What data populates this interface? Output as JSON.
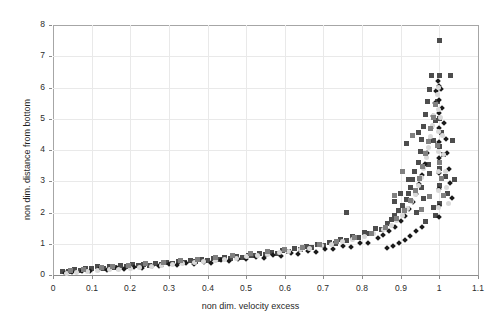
{
  "chart_data": {
    "type": "scatter",
    "title": "",
    "xlabel": "non dim. velocity excess",
    "ylabel": "non dim. distance from bottom",
    "xlim": [
      0,
      1.1
    ],
    "ylim": [
      0,
      8
    ],
    "xticks": [
      "0",
      "0.1",
      "0.2",
      "0.3",
      "0.4",
      "0.5",
      "0.6",
      "0.7",
      "0.8",
      "0.9",
      "1",
      "1.1"
    ],
    "xtick_values": [
      0,
      0.1,
      0.2,
      0.3,
      0.4,
      0.5,
      0.6,
      0.7,
      0.8,
      0.9,
      1.0,
      1.1
    ],
    "yticks": [
      "0",
      "1",
      "2",
      "3",
      "4",
      "5",
      "6",
      "7",
      "8"
    ],
    "ytick_values": [
      0,
      1,
      2,
      3,
      4,
      5,
      6,
      7,
      8
    ],
    "grid": true,
    "grid_color": "#e9e9e9",
    "legend": null,
    "colors": {
      "dark_square": "#4d4d4d",
      "black_diamond": "#1a1a1a",
      "light_marker": "#d9d9d9",
      "mid_gray": "#808080",
      "frame": "#a6a6a6",
      "text": "#1f1f1f"
    },
    "series": [
      {
        "name": "series-dark-square",
        "marker": "square",
        "color": "#4d4d4d",
        "size": 5,
        "points": [
          [
            0.025,
            0.1
          ],
          [
            0.04,
            0.12
          ],
          [
            0.055,
            0.18
          ],
          [
            0.07,
            0.13
          ],
          [
            0.085,
            0.22
          ],
          [
            0.1,
            0.2
          ],
          [
            0.115,
            0.26
          ],
          [
            0.13,
            0.21
          ],
          [
            0.145,
            0.28
          ],
          [
            0.16,
            0.24
          ],
          [
            0.175,
            0.3
          ],
          [
            0.19,
            0.27
          ],
          [
            0.205,
            0.33
          ],
          [
            0.22,
            0.29
          ],
          [
            0.235,
            0.35
          ],
          [
            0.25,
            0.31
          ],
          [
            0.265,
            0.38
          ],
          [
            0.28,
            0.34
          ],
          [
            0.295,
            0.4
          ],
          [
            0.31,
            0.37
          ],
          [
            0.325,
            0.44
          ],
          [
            0.34,
            0.41
          ],
          [
            0.355,
            0.47
          ],
          [
            0.37,
            0.43
          ],
          [
            0.385,
            0.5
          ],
          [
            0.4,
            0.47
          ],
          [
            0.415,
            0.53
          ],
          [
            0.43,
            0.5
          ],
          [
            0.445,
            0.56
          ],
          [
            0.46,
            0.53
          ],
          [
            0.475,
            0.6
          ],
          [
            0.49,
            0.57
          ],
          [
            0.505,
            0.64
          ],
          [
            0.52,
            0.61
          ],
          [
            0.535,
            0.68
          ],
          [
            0.55,
            0.65
          ],
          [
            0.565,
            0.73
          ],
          [
            0.58,
            0.7
          ],
          [
            0.595,
            0.78
          ],
          [
            0.61,
            0.75
          ],
          [
            0.625,
            0.84
          ],
          [
            0.64,
            0.81
          ],
          [
            0.655,
            0.9
          ],
          [
            0.67,
            0.87
          ],
          [
            0.685,
            0.97
          ],
          [
            0.7,
            0.94
          ],
          [
            0.715,
            1.05
          ],
          [
            0.73,
            1.02
          ],
          [
            0.745,
            1.14
          ],
          [
            0.76,
            1.1
          ],
          [
            0.76,
            2.0
          ],
          [
            0.775,
            1.24
          ],
          [
            0.79,
            1.2
          ],
          [
            0.805,
            1.36
          ],
          [
            0.82,
            1.32
          ],
          [
            0.835,
            1.5
          ],
          [
            0.85,
            1.46
          ],
          [
            0.865,
            1.66
          ],
          [
            0.875,
            1.78
          ],
          [
            0.885,
            1.9
          ],
          [
            0.895,
            2.05
          ],
          [
            0.905,
            2.22
          ],
          [
            0.915,
            2.42
          ],
          [
            0.92,
            2.6
          ],
          [
            0.925,
            2.8
          ],
          [
            0.93,
            3.05
          ],
          [
            0.935,
            3.3
          ],
          [
            0.94,
            2.0
          ],
          [
            0.945,
            3.6
          ],
          [
            0.95,
            3.95
          ],
          [
            0.955,
            4.35
          ],
          [
            0.958,
            2.45
          ],
          [
            0.96,
            4.75
          ],
          [
            0.965,
            5.15
          ],
          [
            0.97,
            5.55
          ],
          [
            0.972,
            3.55
          ],
          [
            0.975,
            5.95
          ],
          [
            0.98,
            6.4
          ],
          [
            0.985,
            4.3
          ],
          [
            0.99,
            4.95
          ],
          [
            0.995,
            5.55
          ],
          [
            1.0,
            7.5
          ],
          [
            1.0,
            6.4
          ],
          [
            1.0,
            5.0
          ],
          [
            1.0,
            4.1
          ],
          [
            1.0,
            3.4
          ],
          [
            1.0,
            2.85
          ],
          [
            1.0,
            2.3
          ],
          [
            1.005,
            4.55
          ],
          [
            1.01,
            3.85
          ],
          [
            1.015,
            3.15
          ],
          [
            1.02,
            2.6
          ],
          [
            1.03,
            6.4
          ],
          [
            1.035,
            4.3
          ],
          [
            1.04,
            3.05
          ],
          [
            0.915,
            4.2
          ],
          [
            0.945,
            4.55
          ],
          [
            0.92,
            3.05
          ],
          [
            0.9,
            2.6
          ],
          [
            0.885,
            2.35
          ],
          [
            0.955,
            2.8
          ],
          [
            0.975,
            3.25
          ],
          [
            0.985,
            2.15
          ],
          [
            0.99,
            1.9
          ],
          [
            0.965,
            1.7
          ]
        ]
      },
      {
        "name": "series-black-diamond",
        "marker": "diamond",
        "color": "#1a1a1a",
        "size": 4,
        "points": [
          [
            0.03,
            0.08
          ],
          [
            0.05,
            0.1
          ],
          [
            0.075,
            0.14
          ],
          [
            0.095,
            0.12
          ],
          [
            0.12,
            0.18
          ],
          [
            0.14,
            0.16
          ],
          [
            0.165,
            0.22
          ],
          [
            0.185,
            0.2
          ],
          [
            0.21,
            0.26
          ],
          [
            0.23,
            0.24
          ],
          [
            0.255,
            0.3
          ],
          [
            0.275,
            0.28
          ],
          [
            0.3,
            0.34
          ],
          [
            0.32,
            0.32
          ],
          [
            0.345,
            0.38
          ],
          [
            0.365,
            0.36
          ],
          [
            0.39,
            0.42
          ],
          [
            0.41,
            0.4
          ],
          [
            0.435,
            0.47
          ],
          [
            0.455,
            0.45
          ],
          [
            0.48,
            0.52
          ],
          [
            0.5,
            0.5
          ],
          [
            0.525,
            0.57
          ],
          [
            0.545,
            0.55
          ],
          [
            0.57,
            0.63
          ],
          [
            0.59,
            0.61
          ],
          [
            0.615,
            0.69
          ],
          [
            0.635,
            0.67
          ],
          [
            0.66,
            0.76
          ],
          [
            0.68,
            0.74
          ],
          [
            0.705,
            0.84
          ],
          [
            0.725,
            0.82
          ],
          [
            0.75,
            0.93
          ],
          [
            0.77,
            0.91
          ],
          [
            0.795,
            1.04
          ],
          [
            0.815,
            1.02
          ],
          [
            0.84,
            1.18
          ],
          [
            0.855,
            1.28
          ],
          [
            0.87,
            1.4
          ],
          [
            0.885,
            1.55
          ],
          [
            0.9,
            1.72
          ],
          [
            0.912,
            1.9
          ],
          [
            0.922,
            2.1
          ],
          [
            0.932,
            2.35
          ],
          [
            0.94,
            2.6
          ],
          [
            0.948,
            2.9
          ],
          [
            0.955,
            3.2
          ],
          [
            0.962,
            3.55
          ],
          [
            0.968,
            3.9
          ],
          [
            0.974,
            4.3
          ],
          [
            0.979,
            4.7
          ],
          [
            0.984,
            5.1
          ],
          [
            0.988,
            5.5
          ],
          [
            0.992,
            5.9
          ],
          [
            0.996,
            6.2
          ],
          [
            1.0,
            6.05
          ],
          [
            1.0,
            5.6
          ],
          [
            1.0,
            5.2
          ],
          [
            1.0,
            4.7
          ],
          [
            1.0,
            4.25
          ],
          [
            1.0,
            3.75
          ],
          [
            1.0,
            3.25
          ],
          [
            1.0,
            2.75
          ],
          [
            1.0,
            2.2
          ],
          [
            1.0,
            1.85
          ],
          [
            1.005,
            5.95
          ],
          [
            1.008,
            5.35
          ],
          [
            1.012,
            4.85
          ],
          [
            1.016,
            4.35
          ],
          [
            1.02,
            3.9
          ],
          [
            1.024,
            3.4
          ],
          [
            1.028,
            2.95
          ],
          [
            1.032,
            2.45
          ],
          [
            0.955,
            1.55
          ],
          [
            0.94,
            1.4
          ],
          [
            0.925,
            1.25
          ],
          [
            0.91,
            1.12
          ],
          [
            0.895,
            1.02
          ],
          [
            0.88,
            0.94
          ],
          [
            0.865,
            0.86
          ]
        ]
      },
      {
        "name": "series-light-marker",
        "marker": "circle",
        "color": "#d9d9d9",
        "size": 5,
        "points": [
          [
            0.035,
            0.06
          ],
          [
            0.06,
            0.09
          ],
          [
            0.09,
            0.11
          ],
          [
            0.115,
            0.14
          ],
          [
            0.145,
            0.17
          ],
          [
            0.17,
            0.19
          ],
          [
            0.2,
            0.22
          ],
          [
            0.225,
            0.25
          ],
          [
            0.255,
            0.28
          ],
          [
            0.28,
            0.31
          ],
          [
            0.31,
            0.34
          ],
          [
            0.335,
            0.37
          ],
          [
            0.365,
            0.4
          ],
          [
            0.39,
            0.43
          ],
          [
            0.42,
            0.47
          ],
          [
            0.445,
            0.5
          ],
          [
            0.475,
            0.54
          ],
          [
            0.5,
            0.58
          ],
          [
            0.53,
            0.62
          ],
          [
            0.555,
            0.66
          ],
          [
            0.585,
            0.71
          ],
          [
            0.61,
            0.75
          ],
          [
            0.64,
            0.81
          ],
          [
            0.665,
            0.86
          ],
          [
            0.695,
            0.93
          ],
          [
            0.72,
            0.98
          ],
          [
            0.75,
            1.06
          ],
          [
            0.775,
            1.13
          ],
          [
            0.805,
            1.23
          ],
          [
            0.83,
            1.32
          ],
          [
            0.855,
            1.45
          ],
          [
            0.875,
            1.6
          ],
          [
            0.89,
            1.75
          ],
          [
            0.905,
            1.92
          ],
          [
            0.918,
            2.12
          ],
          [
            0.928,
            2.35
          ],
          [
            0.938,
            2.58
          ],
          [
            0.946,
            2.85
          ],
          [
            0.953,
            3.12
          ],
          [
            0.96,
            3.42
          ],
          [
            0.966,
            3.75
          ],
          [
            0.972,
            4.08
          ],
          [
            0.977,
            4.42
          ],
          [
            0.982,
            4.78
          ],
          [
            0.986,
            5.12
          ],
          [
            0.99,
            5.45
          ],
          [
            0.994,
            5.78
          ],
          [
            0.997,
            6.0
          ],
          [
            0.999,
            5.3
          ],
          [
            0.999,
            4.6
          ],
          [
            0.999,
            3.95
          ],
          [
            0.999,
            3.3
          ],
          [
            0.999,
            2.7
          ],
          [
            0.999,
            2.15
          ],
          [
            1.003,
            5.05
          ],
          [
            1.007,
            4.45
          ],
          [
            1.011,
            3.85
          ],
          [
            1.015,
            3.3
          ],
          [
            1.019,
            2.8
          ],
          [
            1.023,
            2.3
          ]
        ]
      },
      {
        "name": "series-mid-gray",
        "marker": "square",
        "color": "#808080",
        "size": 5,
        "points": [
          [
            0.045,
            0.16
          ],
          [
            0.08,
            0.19
          ],
          [
            0.125,
            0.24
          ],
          [
            0.155,
            0.27
          ],
          [
            0.195,
            0.31
          ],
          [
            0.24,
            0.36
          ],
          [
            0.285,
            0.41
          ],
          [
            0.33,
            0.46
          ],
          [
            0.375,
            0.51
          ],
          [
            0.42,
            0.56
          ],
          [
            0.465,
            0.62
          ],
          [
            0.51,
            0.68
          ],
          [
            0.555,
            0.74
          ],
          [
            0.6,
            0.81
          ],
          [
            0.645,
            0.89
          ],
          [
            0.69,
            0.98
          ],
          [
            0.735,
            1.08
          ],
          [
            0.78,
            1.19
          ],
          [
            0.825,
            1.34
          ],
          [
            0.86,
            1.52
          ],
          [
            0.89,
            1.8
          ],
          [
            0.91,
            2.05
          ],
          [
            0.925,
            2.38
          ],
          [
            0.938,
            2.72
          ],
          [
            0.948,
            3.08
          ],
          [
            0.957,
            3.48
          ],
          [
            0.965,
            3.88
          ],
          [
            0.972,
            4.28
          ],
          [
            0.978,
            4.68
          ],
          [
            0.984,
            5.05
          ],
          [
            0.99,
            5.45
          ],
          [
            0.995,
            4.15
          ],
          [
            1.0,
            3.6
          ],
          [
            1.005,
            3.1
          ],
          [
            1.01,
            2.55
          ],
          [
            0.93,
            4.45
          ],
          [
            0.905,
            3.3
          ],
          [
            0.955,
            2.1
          ],
          [
            0.975,
            2.5
          ],
          [
            0.885,
            2.55
          ]
        ]
      }
    ]
  },
  "axes": {
    "plot_left": 53,
    "plot_top": 25,
    "plot_right": 478,
    "plot_bottom": 275
  }
}
